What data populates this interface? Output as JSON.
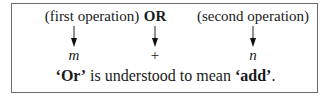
{
  "labels": {
    "first": "(first operation)",
    "middle": "OR",
    "second": "(second operation)"
  },
  "symbols": {
    "first": "m",
    "middle": "+",
    "second": "n"
  },
  "caption": {
    "q1_open": "‘",
    "word1": "Or",
    "q1_close": "’",
    "middle": " is understood to mean ",
    "q2_open": "‘",
    "word2": "add",
    "q2_close": "’",
    "end": "."
  },
  "icons": [
    "arrow-down-icon",
    "arrow-down-icon",
    "arrow-down-icon"
  ]
}
